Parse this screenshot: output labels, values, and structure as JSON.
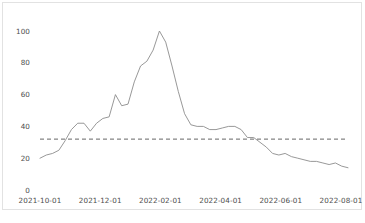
{
  "figure": {
    "background_color": "#ffffff",
    "frame_color": "#e2e2e2",
    "line_color": "#8c8c8c",
    "threshold_color": "#555555",
    "tick_text_color": "#4d4d4d"
  },
  "chart_data": {
    "type": "line",
    "title": "",
    "subtitle": "",
    "xlabel": "",
    "ylabel": "",
    "grid": false,
    "legend": null,
    "ylim": [
      0,
      108
    ],
    "yticks": [
      0,
      20,
      40,
      60,
      80,
      100
    ],
    "ytick_labels": [
      "0",
      "20",
      "40",
      "60",
      "80",
      "100"
    ],
    "xticks": [
      "2021-10-01",
      "2021-12-01",
      "2022-02-01",
      "2022-04-01",
      "2022-06-01",
      "2022-08-01"
    ],
    "xtick_labels": [
      "2021-10-01",
      "2021-12-01",
      "2022-02-01",
      "2022-04-01",
      "2022-06-01",
      "2022-08-01"
    ],
    "xlim": [
      "2021-10-01",
      "2022-09-15"
    ],
    "annotations": [
      {
        "name": "threshold-line",
        "type": "horizontal-dashed-line",
        "value": 32,
        "style": "dashed",
        "color": "#555555"
      }
    ],
    "series": [
      {
        "name": "value",
        "style": "solid",
        "color": "#8c8c8c",
        "x": [
          "2021-10-01",
          "2021-10-08",
          "2021-10-15",
          "2021-10-22",
          "2021-10-29",
          "2021-11-05",
          "2021-11-12",
          "2021-11-19",
          "2021-11-26",
          "2021-12-03",
          "2021-12-10",
          "2021-12-17",
          "2021-12-24",
          "2021-12-31",
          "2022-01-07",
          "2022-01-14",
          "2022-01-21",
          "2022-01-28",
          "2022-02-04",
          "2022-02-11",
          "2022-02-18",
          "2022-02-25",
          "2022-03-04",
          "2022-03-11",
          "2022-03-18",
          "2022-03-25",
          "2022-04-01",
          "2022-04-08",
          "2022-04-15",
          "2022-04-22",
          "2022-04-29",
          "2022-05-06",
          "2022-05-13",
          "2022-05-20",
          "2022-05-27",
          "2022-06-03",
          "2022-06-10",
          "2022-06-17",
          "2022-06-24",
          "2022-07-01",
          "2022-07-08",
          "2022-07-15",
          "2022-07-22",
          "2022-07-29",
          "2022-08-05",
          "2022-08-12",
          "2022-08-19",
          "2022-08-26",
          "2022-09-02",
          "2022-09-09"
        ],
        "values": [
          20,
          22,
          23,
          25,
          31,
          38,
          42,
          42,
          37,
          42,
          45,
          46,
          60,
          53,
          54,
          68,
          78,
          81,
          88,
          100,
          93,
          78,
          62,
          48,
          41,
          40,
          40,
          38,
          38,
          39,
          40,
          40,
          38,
          33,
          33,
          30,
          27,
          23,
          22,
          23,
          21,
          20,
          19,
          18,
          18,
          17,
          16,
          17,
          15,
          14
        ]
      }
    ]
  }
}
